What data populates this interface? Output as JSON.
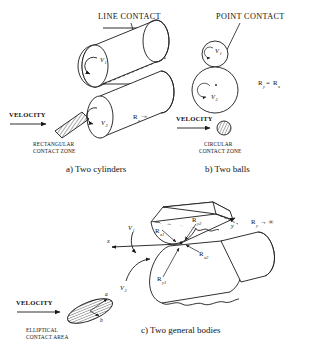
{
  "figure": {
    "headings": {
      "line_contact": "LINE CONTACT",
      "point_contact": "POINT CONTACT"
    },
    "captions": {
      "a": "a) Two cylinders",
      "b": "b) Two balls",
      "c": "c) Two general bodies"
    },
    "velocity_label": "VELOCITY",
    "panel_a": {
      "zone_line1": "RECTANGULAR",
      "zone_line2": "CONTACT ZONE",
      "radius_symbol": "R",
      "radius_sub": "y",
      "radius_value": "=∞",
      "v1": "V",
      "v1_sub": "1",
      "v2": "V",
      "v2_sub": "2"
    },
    "panel_b": {
      "zone_line1": "CIRCULAR",
      "zone_line2": "CONTACT ZONE",
      "radius_eq_left": "R",
      "radius_eq_left_sub": "y",
      "radius_eq_mid": "=",
      "radius_eq_right": "R",
      "radius_eq_right_sub": "x",
      "v1": "V",
      "v1_sub": "1",
      "v2": "V",
      "v2_sub": "2"
    },
    "panel_c": {
      "zone_line1": "ELLIPTICAL",
      "zone_line2": "CONTACT AREA",
      "axis_x": "x",
      "axis_y": "y",
      "ry_symbol": "R",
      "ry_sub": "y",
      "ry_value": "→ ∞",
      "semi_axis_a": "a",
      "semi_axis_b": "b",
      "v1": "V",
      "v1_sub": "1",
      "v2": "V",
      "v2_sub": "2",
      "radii": [
        {
          "symbol": "R",
          "sub": "x1"
        },
        {
          "symbol": "R",
          "sub": "y2"
        },
        {
          "symbol": "R",
          "sub": "x2"
        },
        {
          "symbol": "R",
          "sub": "y1"
        }
      ]
    },
    "colors": {
      "ink": "#1a1a1a",
      "background": "#ffffff"
    }
  }
}
